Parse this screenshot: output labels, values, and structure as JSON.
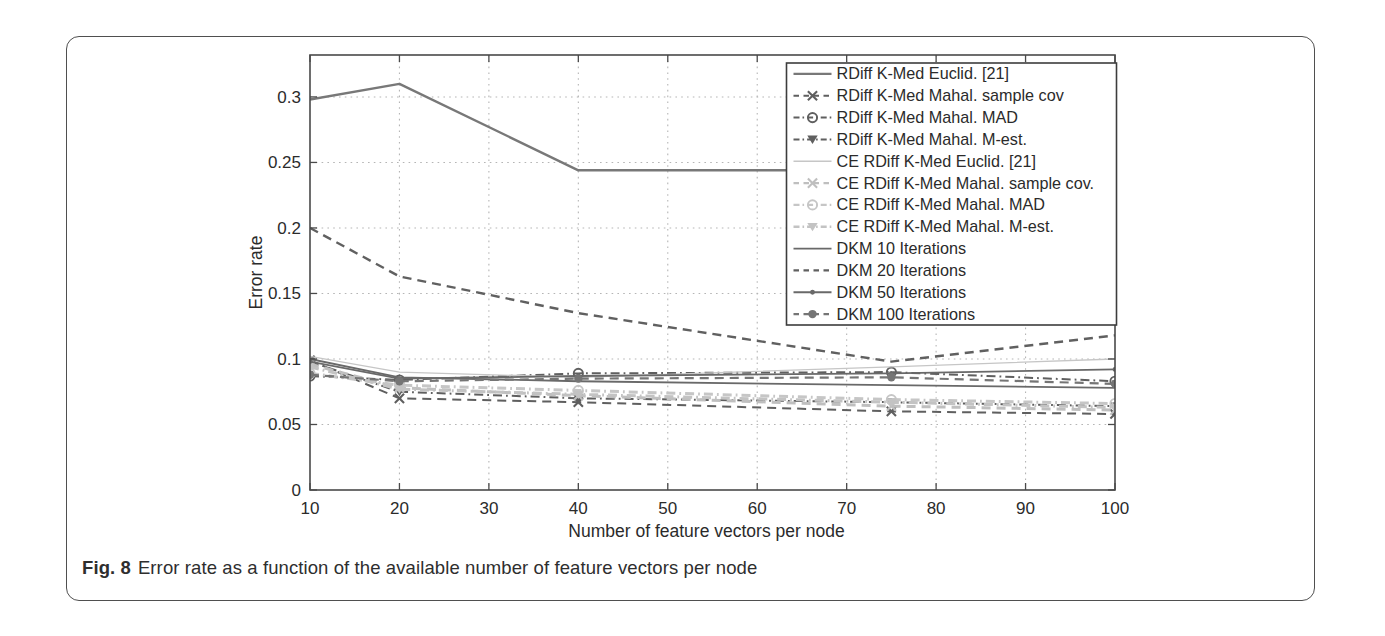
{
  "figure": {
    "caption_label": "Fig. 8",
    "caption_text": "Error rate as a function of the available number of feature vectors per node"
  },
  "chart_data": {
    "type": "line",
    "title": "",
    "xlabel": "Number of feature vectors per node",
    "ylabel": "Error rate",
    "xlim": [
      10,
      100
    ],
    "ylim": [
      0,
      0.332
    ],
    "xticks": [
      10,
      20,
      30,
      40,
      50,
      60,
      70,
      80,
      90,
      100
    ],
    "yticks": [
      0,
      0.05,
      0.1,
      0.15,
      0.2,
      0.25,
      0.3
    ],
    "grid": true,
    "grid_style": "dotted",
    "legend_position": "top-right",
    "x": [
      10,
      20,
      40,
      75,
      100
    ],
    "series": [
      {
        "name": "RDiff K-Med Euclid. [21]",
        "values": [
          0.298,
          0.31,
          0.244,
          0.244,
          0.246
        ],
        "color": "#787878",
        "style": "solid",
        "marker": "none",
        "width": 2.4
      },
      {
        "name": "RDiff K-Med Mahal. sample cov",
        "values": [
          0.099,
          0.07,
          0.067,
          0.06,
          0.058
        ],
        "color": "#5f5f5f",
        "style": "dashed",
        "marker": "x",
        "width": 2.0
      },
      {
        "name": "RDiff K-Med Mahal. MAD",
        "values": [
          0.087,
          0.084,
          0.089,
          0.09,
          0.083
        ],
        "color": "#5f5f5f",
        "style": "dashdot",
        "marker": "circle-open",
        "width": 2.0
      },
      {
        "name": "RDiff K-Med Mahal. M-est.",
        "values": [
          0.098,
          0.075,
          0.07,
          0.067,
          0.064
        ],
        "color": "#5f5f5f",
        "style": "dashdot",
        "marker": "triangle-down",
        "width": 2.0
      },
      {
        "name": "CE RDiff K-Med Euclid. [21]",
        "values": [
          0.102,
          0.09,
          0.086,
          0.094,
          0.1
        ],
        "color": "#c6c6c6",
        "style": "solid",
        "marker": "none",
        "width": 1.3
      },
      {
        "name": "CE RDiff K-Med Mahal. sample cov.",
        "values": [
          0.096,
          0.078,
          0.072,
          0.064,
          0.061
        ],
        "color": "#bfbfbf",
        "style": "dashed",
        "marker": "x",
        "width": 3.0
      },
      {
        "name": "CE RDiff K-Med Mahal. MAD",
        "values": [
          0.089,
          0.08,
          0.076,
          0.069,
          0.066
        ],
        "color": "#c6c6c6",
        "style": "dashdot",
        "marker": "circle-open",
        "width": 3.0
      },
      {
        "name": "CE RDiff K-Med Mahal. M-est.",
        "values": [
          0.094,
          0.077,
          0.073,
          0.067,
          0.063
        ],
        "color": "#c3c3c3",
        "style": "dashdot",
        "marker": "triangle-down",
        "width": 3.0
      },
      {
        "name": "DKM 10 Iterations",
        "values": [
          0.1,
          0.086,
          0.083,
          0.08,
          0.078
        ],
        "color": "#696969",
        "style": "solid",
        "marker": "none",
        "width": 1.8
      },
      {
        "name": "DKM 20 Iterations",
        "values": [
          0.2,
          0.163,
          0.135,
          0.098,
          0.118
        ],
        "color": "#606060",
        "style": "dashed",
        "marker": "none",
        "width": 2.4
      },
      {
        "name": "DKM 50 Iterations",
        "values": [
          0.098,
          0.085,
          0.087,
          0.089,
          0.092
        ],
        "color": "#696969",
        "style": "solid",
        "marker": "dot",
        "width": 1.8
      },
      {
        "name": "DKM 100 Iterations",
        "values": [
          0.088,
          0.083,
          0.085,
          0.086,
          0.081
        ],
        "color": "#757575",
        "style": "dashed",
        "marker": "circle-filled",
        "width": 2.2
      }
    ],
    "colors": {
      "axis": "#4a4a4a",
      "grid": "#b5b5b5",
      "tick_label": "#2b2b2b",
      "legend_border": "#3d3d3d",
      "legend_bg": "#ffffff"
    }
  }
}
